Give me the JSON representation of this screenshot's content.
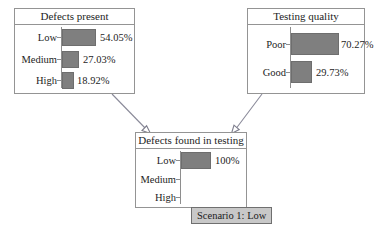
{
  "diagram": {
    "background_color": "#ffffff",
    "node_border_color": "#949494",
    "bar_color": "#7f7f7f",
    "edge_color": "#8a8a99"
  },
  "nodes": [
    {
      "id": "defects-present",
      "title": "Defects present",
      "bars": [
        {
          "label": "Low",
          "value": 54.05,
          "value_text": "54.05%"
        },
        {
          "label": "Medium",
          "value": 27.03,
          "value_text": "27.03%"
        },
        {
          "label": "High",
          "value": 18.92,
          "value_text": "18.92%"
        }
      ]
    },
    {
      "id": "testing-quality",
      "title": "Testing quality",
      "bars": [
        {
          "label": "Poor",
          "value": 70.27,
          "value_text": "70.27%"
        },
        {
          "label": "Good",
          "value": 29.73,
          "value_text": "29.73%"
        }
      ]
    },
    {
      "id": "defects-found-in-testing",
      "title": "Defects found in testing",
      "bars": [
        {
          "label": "Low",
          "value": 100,
          "value_text": "100%"
        },
        {
          "label": "Medium",
          "value": 0,
          "value_text": ""
        },
        {
          "label": "High",
          "value": 0,
          "value_text": ""
        }
      ]
    }
  ],
  "edges": [
    {
      "from": "defects-present",
      "to": "defects-found-in-testing",
      "arrowhead": "hollow-triangle"
    },
    {
      "from": "testing-quality",
      "to": "defects-found-in-testing",
      "arrowhead": "hollow-triangle"
    }
  ],
  "scenario": {
    "label": "Scenario 1: Low",
    "background_color": "#c8c8c8"
  }
}
